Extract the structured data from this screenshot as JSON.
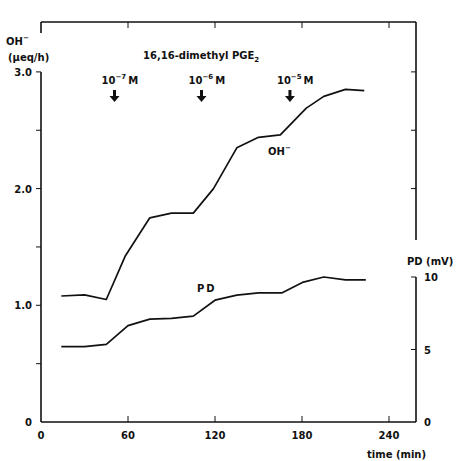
{
  "chart_data": {
    "type": "line",
    "title": "16,16-dimethyl PGE2",
    "title_main": "16,16-dimethyl  PGE",
    "title_sub": "2",
    "xlabel": "time (min)",
    "xlim": [
      0,
      260
    ],
    "xticks": [
      0,
      60,
      120,
      180,
      240
    ],
    "xtick_labels": [
      "0",
      "60",
      "120",
      "180",
      "240"
    ],
    "y_left": {
      "label_line1": "OH",
      "label_line1_sup": "−",
      "label_line2": "(μeq/h)",
      "ylim": [
        0,
        3.0
      ],
      "ticks": [
        0,
        0.5,
        1.0,
        1.5,
        2.0,
        2.5,
        3.0
      ],
      "tick_labels": {
        "0": "0",
        "1.0": "1.0",
        "2.0": "2.0",
        "3.0": "3.0"
      }
    },
    "y_right": {
      "label": "PD (mV)",
      "ylim": [
        0,
        10
      ],
      "ticks": [
        0,
        5,
        10
      ],
      "tick_labels": [
        "0",
        "5",
        "10"
      ]
    },
    "series": [
      {
        "name": "OH−",
        "label": "OH",
        "label_sup": "−",
        "axis": "left",
        "x": [
          14,
          30,
          45,
          58,
          75,
          90,
          105,
          119,
          135,
          150,
          165,
          183,
          195,
          210,
          223
        ],
        "values": [
          1.08,
          1.09,
          1.05,
          1.42,
          1.75,
          1.79,
          1.79,
          2.0,
          2.35,
          2.44,
          2.46,
          2.69,
          2.79,
          2.85,
          2.84
        ]
      },
      {
        "name": "PD",
        "label": "PD",
        "axis": "right",
        "x": [
          14,
          30,
          45,
          60,
          75,
          90,
          105,
          120,
          135,
          150,
          166,
          181,
          195,
          210,
          224
        ],
        "values": [
          5.2,
          5.2,
          5.35,
          6.65,
          7.1,
          7.15,
          7.3,
          8.4,
          8.75,
          8.9,
          8.9,
          9.65,
          10.0,
          9.8,
          9.8
        ]
      }
    ],
    "annotations": [
      {
        "type": "arrow",
        "x": 50,
        "text_base": "10",
        "text_exp": "−7",
        "text_unit": "M"
      },
      {
        "type": "arrow",
        "x": 110,
        "text_base": "10",
        "text_exp": "−6",
        "text_unit": "M"
      },
      {
        "type": "arrow",
        "x": 171,
        "text_base": "10",
        "text_exp": "−5",
        "text_unit": "M"
      }
    ],
    "grid": false,
    "legend": "inline labels"
  }
}
